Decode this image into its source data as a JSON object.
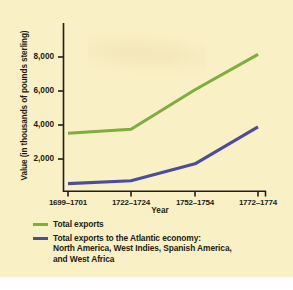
{
  "figure": {
    "background_color": "#faf0c6",
    "page_color": "#ffffff"
  },
  "chart_data": {
    "type": "line",
    "title": "",
    "xlabel": "Year",
    "ylabel": "Value (in thousands of pounds sterling)",
    "categories": [
      "1699–1701",
      "1722–1724",
      "1752–1754",
      "1772–1774"
    ],
    "ylim": [
      0,
      9000
    ],
    "yticks": [
      2000,
      4000,
      6000,
      8000
    ],
    "ytick_labels": [
      "2,000",
      "4,000",
      "6,000",
      "8,000"
    ],
    "grid": false,
    "legend_position": "below",
    "series": [
      {
        "name": "Total exports",
        "color": "#7dae3e",
        "values": [
          3600,
          3850,
          6300,
          8500
        ]
      },
      {
        "name": "Total exports to the Atlantic economy: North America, West Indies, Spanish America, and West Africa",
        "color": "#4b4c9d",
        "values": [
          470,
          650,
          1700,
          4000
        ]
      }
    ]
  },
  "legend": {
    "items": [
      {
        "color": "#7dae3e",
        "lines": [
          "Total exports"
        ]
      },
      {
        "color": "#4b4c9d",
        "lines": [
          "Total exports to the Atlantic economy:",
          "North America, West Indies, Spanish America,",
          "and West Africa"
        ]
      }
    ]
  }
}
